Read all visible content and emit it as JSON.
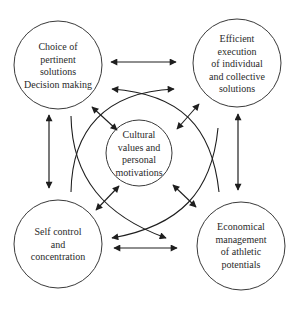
{
  "diagram": {
    "colors": {
      "stroke": "#2a2a2a",
      "background": "#ffffff",
      "text": "#2a2a2a"
    },
    "nodes": [
      {
        "id": "tl",
        "lines": [
          "Choice of",
          "pertinent",
          "solutions",
          "Decision making"
        ]
      },
      {
        "id": "tr",
        "lines": [
          "Efficient",
          "execution",
          "of individual",
          "and collective",
          "solutions"
        ]
      },
      {
        "id": "center",
        "lines": [
          "Cultural",
          "values and",
          "personal",
          "motivations"
        ]
      },
      {
        "id": "bl",
        "lines": [
          "Self control",
          "and",
          "concentration"
        ]
      },
      {
        "id": "br",
        "lines": [
          "Economical",
          "management",
          "of athletic",
          "potentials"
        ]
      }
    ],
    "connections": [
      {
        "from": "tl",
        "to": "tr",
        "type": "double-arrow"
      },
      {
        "from": "bl",
        "to": "br",
        "type": "double-arrow"
      },
      {
        "from": "tl",
        "to": "bl",
        "type": "double-arrow"
      },
      {
        "from": "tr",
        "to": "br",
        "type": "double-arrow"
      },
      {
        "from": "tl",
        "to": "center",
        "type": "double-arrow"
      },
      {
        "from": "tr",
        "to": "center",
        "type": "double-arrow"
      },
      {
        "from": "bl",
        "to": "center",
        "type": "double-arrow"
      },
      {
        "from": "br",
        "to": "center",
        "type": "double-arrow"
      },
      {
        "from": "bl",
        "to": "tr",
        "type": "curved-arrow"
      },
      {
        "from": "tl",
        "to": "br",
        "type": "curved-arrow"
      },
      {
        "from": "tr",
        "to": "bl",
        "type": "curved-arrow"
      },
      {
        "from": "br",
        "to": "tl",
        "type": "curved-arrow"
      }
    ]
  }
}
